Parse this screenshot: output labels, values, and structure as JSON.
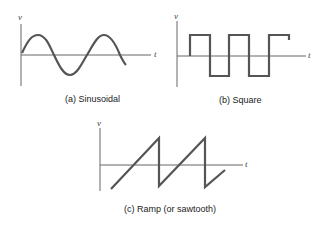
{
  "panels": [
    {
      "id": "a",
      "caption": "(a) Sinusoidal",
      "y_label": "v",
      "x_label": "t",
      "waveform": "sinusoidal"
    },
    {
      "id": "b",
      "caption": "(b) Square",
      "y_label": "v",
      "x_label": "t",
      "waveform": "square"
    },
    {
      "id": "c",
      "caption": "(c) Ramp (or sawtooth)",
      "y_label": "v",
      "x_label": "t",
      "waveform": "ramp"
    }
  ],
  "colors": {
    "axis": "#555555",
    "trace": "#555555"
  }
}
